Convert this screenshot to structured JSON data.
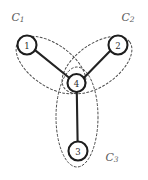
{
  "figure": {
    "width": 148,
    "height": 180,
    "background": "#ffffff",
    "type": "node-link-diagram"
  },
  "palette": {
    "node_stroke": "#1d1d1d",
    "node_fill": "#ffffff",
    "edge_stroke": "#232323",
    "cluster_stroke": "#4a4a4a",
    "cluster_label": "#5c5c5c",
    "node_label": "#2b2b2b"
  },
  "nodes": [
    {
      "id": "1",
      "label": "1",
      "cx": 27,
      "cy": 45,
      "r": 9.5
    },
    {
      "id": "2",
      "label": "2",
      "cx": 118,
      "cy": 45,
      "r": 9.5
    },
    {
      "id": "3",
      "label": "3",
      "cx": 78,
      "cy": 151,
      "r": 9.5
    },
    {
      "id": "4",
      "label": "4",
      "cx": 76.5,
      "cy": 83,
      "r": 9.0
    }
  ],
  "edges": [
    {
      "id": "edge-1-4",
      "source": "1",
      "target": "4",
      "x1": 35.0,
      "y1": 50.1,
      "x2": 69.2,
      "y2": 77.8
    },
    {
      "id": "edge-2-4",
      "source": "2",
      "target": "4",
      "x1": 110.3,
      "y1": 50.8,
      "x2": 84.2,
      "y2": 77.6
    },
    {
      "id": "edge-3-4",
      "source": "3",
      "target": "4",
      "x1": 77.6,
      "y1": 141.5,
      "x2": 76.8,
      "y2": 92.0
    }
  ],
  "clusters": [
    {
      "id": "C1",
      "label": "C",
      "subscript": "1",
      "members": [
        "1",
        "4"
      ],
      "label_x": 18,
      "label_y": 17,
      "ellipse": {
        "cx": 51,
        "cy": 65,
        "rx": 40,
        "ry": 21,
        "rotate": 35
      }
    },
    {
      "id": "C2",
      "label": "C",
      "subscript": "2",
      "members": [
        "2",
        "4"
      ],
      "label_x": 128,
      "label_y": 17,
      "ellipse": {
        "cx": 97,
        "cy": 65,
        "rx": 40,
        "ry": 21,
        "rotate": -35
      }
    },
    {
      "id": "C3",
      "label": "C",
      "subscript": "3",
      "members": [
        "3",
        "4"
      ],
      "label_x": 112,
      "label_y": 157,
      "ellipse": {
        "cx": 77,
        "cy": 117,
        "rx": 21,
        "ry": 50,
        "rotate": 0
      }
    }
  ]
}
